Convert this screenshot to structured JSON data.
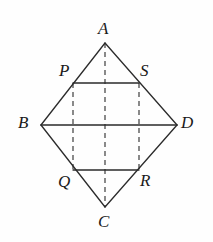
{
  "figure": {
    "name": "rhombus-with-inscribed-rectangle",
    "canvas": {
      "width": 213,
      "height": 242
    },
    "background_color": "#fefefe",
    "stroke_color": "#2b2b2b",
    "label_color": "#1a1a1a",
    "solid_stroke_width": 1.3,
    "dashed_stroke_width": 1.1,
    "dash_pattern": "5,4",
    "points": {
      "A": {
        "label": "A",
        "x": 105,
        "y": 43,
        "label_x": 98,
        "label_y": 20
      },
      "B": {
        "label": "B",
        "x": 41,
        "y": 125,
        "label_x": 18,
        "label_y": 114
      },
      "C": {
        "label": "C",
        "x": 105,
        "y": 207,
        "label_x": 98,
        "label_y": 213
      },
      "D": {
        "label": "D",
        "x": 177,
        "y": 125,
        "label_x": 181,
        "label_y": 114
      },
      "P": {
        "label": "P",
        "x": 73,
        "y": 83,
        "label_x": 59,
        "label_y": 62
      },
      "S": {
        "label": "S",
        "x": 139,
        "y": 83,
        "label_x": 140,
        "label_y": 62
      },
      "Q": {
        "label": "Q",
        "x": 73,
        "y": 170,
        "label_x": 58,
        "label_y": 173
      },
      "R": {
        "label": "R",
        "x": 139,
        "y": 170,
        "label_x": 140,
        "label_y": 172
      }
    },
    "solid_segments": [
      {
        "name": "side-AB",
        "x1": 105,
        "y1": 43,
        "x2": 41,
        "y2": 125
      },
      {
        "name": "side-AD",
        "x1": 105,
        "y1": 43,
        "x2": 177,
        "y2": 125
      },
      {
        "name": "side-BC",
        "x1": 41,
        "y1": 125,
        "x2": 105,
        "y2": 207
      },
      {
        "name": "side-DC",
        "x1": 177,
        "y1": 125,
        "x2": 105,
        "y2": 207
      },
      {
        "name": "diagonal-BD",
        "x1": 41,
        "y1": 125,
        "x2": 177,
        "y2": 125
      },
      {
        "name": "chord-PS",
        "x1": 73,
        "y1": 83,
        "x2": 139,
        "y2": 83
      },
      {
        "name": "chord-QR",
        "x1": 73,
        "y1": 170,
        "x2": 139,
        "y2": 170
      }
    ],
    "dashed_segments": [
      {
        "name": "diagonal-AC",
        "x1": 105,
        "y1": 43,
        "x2": 105,
        "y2": 207
      },
      {
        "name": "vertical-PQ",
        "x1": 73,
        "y1": 83,
        "x2": 73,
        "y2": 170
      },
      {
        "name": "vertical-SR",
        "x1": 139,
        "y1": 83,
        "x2": 139,
        "y2": 170
      }
    ],
    "labels": [
      "A",
      "P",
      "S",
      "B",
      "D",
      "Q",
      "R",
      "C"
    ]
  }
}
